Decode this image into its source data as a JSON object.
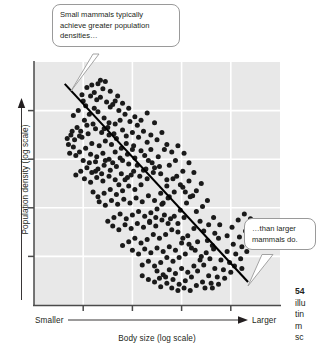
{
  "figure": {
    "name": "mammal-body-size-vs-population-density-scatter"
  },
  "axes": {
    "y_title": "Population density (log scale)",
    "x_title": "Body size (log scale)",
    "x_low_label": "Smaller",
    "x_high_label": "Larger"
  },
  "callouts": {
    "top": {
      "line1": "Small mammals typically",
      "line2": "achieve greater population",
      "line3": "densities…"
    },
    "right": {
      "line1": "…than larger",
      "line2": "mammals do."
    }
  },
  "caption": {
    "number": "54",
    "line1": "illu",
    "line2": "tin",
    "line3": "m",
    "line4": "sc"
  },
  "colors": {
    "plot_background": "#e8e8e8",
    "gridline": "#ffffff",
    "axis_line": "#4a4a4a",
    "point": "#1a1a1a",
    "trend_line": "#000000",
    "callout_border": "#9a9a9a",
    "text": "#231f20",
    "page_background": "#ffffff"
  },
  "chart_data": {
    "type": "scatter",
    "title": "",
    "xlabel": "Body size (log scale)",
    "ylabel": "Population density (log scale)",
    "xlim": [
      0,
      10
    ],
    "ylim": [
      0,
      10
    ],
    "grid": true,
    "legend": null,
    "x_ticks": [
      2,
      4,
      6,
      8
    ],
    "y_ticks": [
      2,
      4,
      6,
      8
    ],
    "x_tick_labels": [],
    "y_tick_labels": [],
    "annotations": [
      {
        "text": "Small mammals typically achieve greater population densities…",
        "points_to": [
          1.2,
          9.0
        ]
      },
      {
        "text": "…than larger mammals do.",
        "points_to": [
          8.7,
          1.0
        ]
      }
    ],
    "trend_line": {
      "x": [
        1.25,
        8.7
      ],
      "y": [
        9.1,
        0.95
      ]
    },
    "points": [
      [
        1.95,
        8.65
      ],
      [
        2.15,
        8.95
      ],
      [
        2.35,
        9.05
      ],
      [
        2.55,
        8.45
      ],
      [
        2.1,
        8.2
      ],
      [
        2.45,
        8.1
      ],
      [
        2.7,
        8.55
      ],
      [
        2.95,
        8.35
      ],
      [
        2.25,
        7.85
      ],
      [
        2.6,
        7.95
      ],
      [
        2.85,
        7.7
      ],
      [
        3.1,
        8.15
      ],
      [
        3.3,
        8.4
      ],
      [
        3.05,
        7.5
      ],
      [
        2.4,
        7.45
      ],
      [
        2.05,
        7.6
      ],
      [
        1.75,
        7.3
      ],
      [
        1.55,
        7.15
      ],
      [
        1.85,
        6.95
      ],
      [
        2.2,
        7.05
      ],
      [
        2.5,
        7.25
      ],
      [
        2.75,
        7.1
      ],
      [
        3.0,
        7.3
      ],
      [
        3.25,
        7.05
      ],
      [
        3.5,
        7.6
      ],
      [
        3.45,
        8.0
      ],
      [
        3.7,
        7.85
      ],
      [
        3.9,
        7.55
      ],
      [
        3.6,
        7.2
      ],
      [
        3.35,
        6.85
      ],
      [
        3.15,
        6.6
      ],
      [
        2.9,
        6.75
      ],
      [
        2.65,
        6.55
      ],
      [
        2.35,
        6.65
      ],
      [
        2.1,
        6.45
      ],
      [
        1.85,
        6.3
      ],
      [
        1.6,
        6.5
      ],
      [
        1.4,
        6.6
      ],
      [
        1.65,
        6.8
      ],
      [
        1.95,
        6.9
      ],
      [
        2.3,
        6.2
      ],
      [
        2.55,
        6.1
      ],
      [
        2.8,
        6.25
      ],
      [
        3.05,
        6.0
      ],
      [
        3.3,
        6.3
      ],
      [
        3.55,
        6.45
      ],
      [
        3.8,
        6.2
      ],
      [
        4.05,
        6.55
      ],
      [
        4.25,
        6.9
      ],
      [
        4.0,
        7.1
      ],
      [
        4.2,
        7.4
      ],
      [
        4.45,
        7.15
      ],
      [
        4.6,
        6.7
      ],
      [
        4.35,
        6.35
      ],
      [
        4.1,
        6.05
      ],
      [
        3.85,
        5.8
      ],
      [
        3.6,
        5.95
      ],
      [
        3.35,
        5.7
      ],
      [
        3.1,
        5.55
      ],
      [
        2.85,
        5.75
      ],
      [
        2.6,
        5.6
      ],
      [
        2.35,
        5.45
      ],
      [
        2.15,
        5.65
      ],
      [
        1.9,
        5.5
      ],
      [
        1.7,
        5.35
      ],
      [
        2.05,
        5.2
      ],
      [
        2.3,
        5.05
      ],
      [
        2.55,
        5.25
      ],
      [
        2.8,
        5.1
      ],
      [
        3.05,
        5.3
      ],
      [
        3.3,
        5.15
      ],
      [
        3.55,
        5.4
      ],
      [
        3.8,
        5.25
      ],
      [
        4.05,
        5.5
      ],
      [
        4.3,
        5.3
      ],
      [
        4.55,
        5.6
      ],
      [
        4.8,
        5.85
      ],
      [
        5.05,
        6.1
      ],
      [
        5.3,
        6.4
      ],
      [
        5.1,
        5.7
      ],
      [
        4.85,
        5.45
      ],
      [
        4.6,
        5.2
      ],
      [
        4.35,
        4.95
      ],
      [
        4.1,
        4.75
      ],
      [
        3.85,
        4.9
      ],
      [
        3.6,
        4.7
      ],
      [
        3.35,
        4.55
      ],
      [
        3.1,
        4.75
      ],
      [
        2.85,
        4.6
      ],
      [
        2.6,
        4.45
      ],
      [
        2.4,
        4.65
      ],
      [
        2.65,
        4.25
      ],
      [
        2.9,
        4.1
      ],
      [
        3.15,
        4.3
      ],
      [
        3.4,
        4.15
      ],
      [
        3.65,
        4.35
      ],
      [
        3.9,
        4.2
      ],
      [
        4.15,
        4.4
      ],
      [
        4.4,
        4.25
      ],
      [
        4.65,
        4.5
      ],
      [
        4.9,
        4.3
      ],
      [
        5.15,
        4.6
      ],
      [
        5.4,
        4.9
      ],
      [
        5.65,
        5.2
      ],
      [
        5.5,
        4.45
      ],
      [
        5.25,
        4.2
      ],
      [
        5.0,
        3.95
      ],
      [
        4.75,
        3.8
      ],
      [
        4.5,
        3.65
      ],
      [
        4.25,
        3.85
      ],
      [
        4.0,
        3.7
      ],
      [
        3.75,
        3.55
      ],
      [
        3.5,
        3.75
      ],
      [
        3.25,
        3.6
      ],
      [
        3.0,
        3.45
      ],
      [
        3.2,
        3.25
      ],
      [
        3.45,
        3.1
      ],
      [
        3.7,
        3.3
      ],
      [
        3.95,
        3.15
      ],
      [
        4.2,
        3.35
      ],
      [
        4.45,
        3.2
      ],
      [
        4.7,
        3.4
      ],
      [
        4.95,
        3.25
      ],
      [
        5.2,
        3.5
      ],
      [
        5.45,
        3.35
      ],
      [
        5.7,
        3.65
      ],
      [
        5.95,
        3.9
      ],
      [
        6.2,
        4.2
      ],
      [
        6.45,
        4.5
      ],
      [
        6.1,
        3.6
      ],
      [
        5.85,
        3.35
      ],
      [
        5.6,
        3.1
      ],
      [
        5.35,
        2.9
      ],
      [
        5.1,
        2.75
      ],
      [
        4.85,
        2.9
      ],
      [
        4.6,
        2.7
      ],
      [
        4.35,
        2.55
      ],
      [
        4.1,
        2.75
      ],
      [
        3.85,
        2.6
      ],
      [
        3.6,
        2.45
      ],
      [
        4.0,
        2.25
      ],
      [
        4.25,
        2.1
      ],
      [
        4.5,
        2.3
      ],
      [
        4.75,
        2.15
      ],
      [
        5.0,
        2.35
      ],
      [
        5.25,
        2.2
      ],
      [
        5.5,
        2.4
      ],
      [
        5.75,
        2.25
      ],
      [
        6.0,
        2.55
      ],
      [
        6.25,
        2.85
      ],
      [
        6.5,
        3.15
      ],
      [
        6.75,
        3.45
      ],
      [
        6.65,
        2.6
      ],
      [
        6.4,
        2.35
      ],
      [
        6.15,
        2.1
      ],
      [
        5.9,
        1.95
      ],
      [
        5.65,
        1.8
      ],
      [
        5.4,
        1.95
      ],
      [
        5.15,
        1.75
      ],
      [
        4.9,
        1.6
      ],
      [
        4.65,
        1.8
      ],
      [
        4.4,
        1.65
      ],
      [
        5.0,
        1.4
      ],
      [
        5.25,
        1.25
      ],
      [
        5.5,
        1.45
      ],
      [
        5.75,
        1.3
      ],
      [
        6.0,
        1.5
      ],
      [
        6.25,
        1.35
      ],
      [
        6.5,
        1.6
      ],
      [
        6.75,
        1.85
      ],
      [
        7.0,
        2.15
      ],
      [
        7.25,
        2.45
      ],
      [
        7.5,
        2.75
      ],
      [
        7.15,
        1.9
      ],
      [
        6.9,
        1.65
      ],
      [
        6.65,
        1.4
      ],
      [
        6.4,
        1.15
      ],
      [
        6.15,
        1.0
      ],
      [
        5.9,
        0.85
      ],
      [
        5.65,
        1.05
      ],
      [
        5.4,
        0.9
      ],
      [
        5.15,
        0.75
      ],
      [
        4.9,
        0.95
      ],
      [
        6.6,
        0.8
      ],
      [
        6.85,
        0.95
      ],
      [
        7.1,
        1.2
      ],
      [
        7.35,
        1.5
      ],
      [
        7.6,
        1.85
      ],
      [
        7.85,
        2.2
      ],
      [
        8.1,
        2.5
      ],
      [
        8.35,
        2.8
      ],
      [
        8.6,
        3.05
      ],
      [
        8.2,
        2.1
      ],
      [
        7.95,
        1.75
      ],
      [
        7.7,
        1.45
      ],
      [
        7.45,
        1.15
      ],
      [
        7.2,
        0.9
      ],
      [
        6.95,
        0.7
      ],
      [
        8.45,
        2.4
      ],
      [
        8.7,
        2.65
      ],
      [
        2.0,
        8.4
      ],
      [
        2.3,
        8.6
      ],
      [
        2.8,
        8.9
      ],
      [
        3.4,
        8.6
      ],
      [
        3.2,
        8.25
      ],
      [
        1.8,
        8.0
      ],
      [
        1.6,
        7.8
      ],
      [
        4.6,
        7.9
      ],
      [
        4.9,
        7.5
      ],
      [
        5.2,
        7.1
      ],
      [
        5.0,
        6.8
      ],
      [
        4.75,
        7.0
      ],
      [
        5.4,
        6.6
      ],
      [
        5.6,
        6.3
      ],
      [
        5.85,
        6.55
      ],
      [
        6.1,
        6.25
      ],
      [
        5.75,
        5.95
      ],
      [
        5.5,
        5.75
      ],
      [
        6.3,
        5.85
      ],
      [
        6.05,
        5.5
      ],
      [
        5.8,
        5.3
      ],
      [
        6.5,
        5.45
      ],
      [
        6.3,
        5.1
      ],
      [
        6.05,
        4.85
      ],
      [
        6.8,
        5.0
      ],
      [
        6.6,
        4.7
      ],
      [
        6.35,
        4.45
      ],
      [
        7.05,
        4.3
      ],
      [
        6.85,
        4.05
      ],
      [
        6.6,
        3.85
      ],
      [
        7.3,
        3.6
      ],
      [
        7.1,
        3.3
      ],
      [
        6.9,
        3.05
      ],
      [
        7.55,
        3.3
      ],
      [
        7.35,
        2.95
      ],
      [
        7.85,
        2.85
      ],
      [
        8.05,
        3.2
      ],
      [
        8.3,
        3.5
      ],
      [
        8.55,
        3.75
      ],
      [
        8.8,
        3.55
      ],
      [
        2.9,
        9.2
      ],
      [
        3.1,
        8.8
      ],
      [
        2.6,
        9.1
      ],
      [
        1.5,
        7.0
      ],
      [
        1.35,
        6.85
      ],
      [
        1.7,
        6.15
      ],
      [
        1.45,
        6.25
      ],
      [
        2.0,
        5.95
      ],
      [
        2.25,
        5.85
      ],
      [
        2.5,
        5.9
      ],
      [
        2.9,
        5.95
      ],
      [
        3.2,
        5.85
      ],
      [
        3.5,
        6.05
      ],
      [
        3.75,
        6.65
      ],
      [
        4.0,
        6.4
      ],
      [
        4.5,
        6.15
      ],
      [
        4.75,
        6.4
      ],
      [
        4.2,
        5.75
      ],
      [
        4.45,
        5.55
      ],
      [
        3.95,
        5.35
      ],
      [
        3.7,
        5.15
      ],
      [
        3.45,
        4.95
      ],
      [
        2.75,
        5.4
      ],
      [
        2.5,
        5.5
      ],
      [
        5.95,
        4.95
      ],
      [
        6.15,
        4.65
      ],
      [
        5.7,
        4.65
      ],
      [
        5.45,
        4.4
      ],
      [
        5.2,
        4.15
      ],
      [
        4.95,
        3.6
      ],
      [
        4.7,
        3.45
      ],
      [
        5.3,
        3.7
      ],
      [
        5.55,
        3.55
      ],
      [
        5.85,
        3.0
      ],
      [
        6.05,
        2.75
      ],
      [
        6.3,
        2.5
      ],
      [
        6.55,
        2.25
      ],
      [
        6.8,
        2.0
      ],
      [
        7.05,
        2.65
      ],
      [
        7.3,
        2.3
      ],
      [
        5.1,
        1.1
      ],
      [
        5.35,
        1.15
      ],
      [
        5.6,
        0.7
      ],
      [
        5.85,
        0.6
      ],
      [
        6.1,
        0.7
      ],
      [
        6.35,
        0.6
      ],
      [
        4.65,
        1.05
      ],
      [
        4.4,
        1.2
      ],
      [
        8.15,
        1.6
      ],
      [
        8.4,
        1.9
      ],
      [
        8.65,
        2.2
      ],
      [
        7.75,
        1.1
      ],
      [
        8.0,
        1.35
      ],
      [
        7.5,
        0.85
      ],
      [
        7.25,
        0.7
      ],
      [
        8.45,
        1.5
      ],
      [
        2.45,
        8.75
      ],
      [
        2.7,
        9.25
      ],
      [
        3.6,
        8.3
      ],
      [
        3.85,
        8.1
      ],
      [
        4.1,
        7.75
      ],
      [
        4.35,
        7.6
      ],
      [
        1.9,
        7.15
      ],
      [
        2.15,
        7.4
      ],
      [
        3.05,
        7.0
      ],
      [
        3.3,
        7.45
      ],
      [
        2.85,
        7.25
      ],
      [
        3.75,
        6.95
      ],
      [
        4.65,
        5.95
      ],
      [
        4.9,
        5.65
      ],
      [
        5.15,
        5.4
      ],
      [
        5.4,
        5.15
      ]
    ]
  }
}
